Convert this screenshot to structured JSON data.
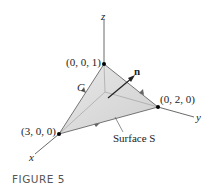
{
  "figure": {
    "caption": "FIGURE 5",
    "axes": {
      "x": "x",
      "y": "y",
      "z": "z"
    },
    "points": [
      {
        "label": "(0, 0, 1)"
      },
      {
        "label": "(0, 2, 0)"
      },
      {
        "label": "(3, 0, 0)"
      }
    ],
    "curve_label": "C",
    "normal_label": "n",
    "surface_label": "Surface S",
    "colors": {
      "surface": "#dcdcdc",
      "line": "#333333",
      "background": "#ffffff"
    }
  }
}
